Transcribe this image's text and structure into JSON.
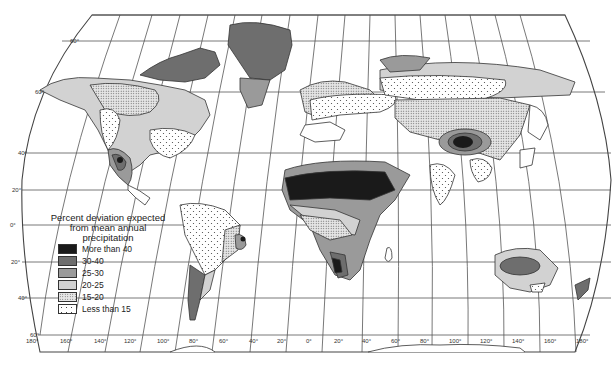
{
  "map": {
    "title_fragment": "",
    "legend": {
      "title_lines": [
        "Percent deviation expected",
        "from mean annual",
        "precipitation"
      ],
      "items": [
        {
          "label": "More than 40",
          "fill": "#1a1a1a",
          "pattern": "solid"
        },
        {
          "label": "30-40",
          "fill": "#6e6e6e",
          "pattern": "solid"
        },
        {
          "label": "25-30",
          "fill": "#9a9a9a",
          "pattern": "solid"
        },
        {
          "label": "20-25",
          "fill": "#d2d2d2",
          "pattern": "solid"
        },
        {
          "label": "15-20",
          "fill": "#e9e9e9",
          "pattern": "fine-dots"
        },
        {
          "label": "Less than 15",
          "fill": "#ffffff",
          "pattern": "sparse-dots"
        }
      ]
    },
    "latitude_labels": [
      "60°",
      "40°",
      "20°",
      "0°",
      "20°",
      "40°",
      "60°"
    ],
    "latitude_values": [
      60,
      40,
      20,
      0,
      -20,
      -40,
      -60
    ],
    "longitude_labels": [
      "180°",
      "160°",
      "140°",
      "120°",
      "100°",
      "80°",
      "60°",
      "40°",
      "20°",
      "0°",
      "20°",
      "40°",
      "60°",
      "80°",
      "100°",
      "120°",
      "140°",
      "160°",
      "180°"
    ],
    "colors": {
      "background": "#ffffff",
      "gridline": "#555555",
      "coastline": "#333333"
    }
  }
}
